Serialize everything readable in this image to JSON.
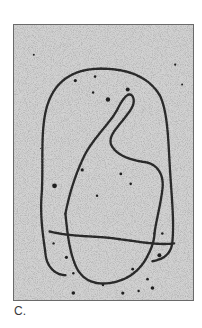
{
  "figure": {
    "panel_label": "C.",
    "colors": {
      "background": "#c9c9c9",
      "strand": "#2b2b2b",
      "frame": "#6a6a6a"
    }
  }
}
